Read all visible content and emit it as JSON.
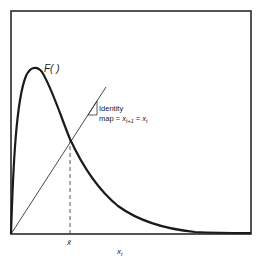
{
  "diagram": {
    "curve_label": "F( )",
    "identity_label_line1": "Identity",
    "identity_label_line2_prefix": "map = ",
    "identity_x": "x",
    "identity_sub_next": "t+1",
    "identity_eq": " = ",
    "identity_sub_cur": "t",
    "fixed_point_label": "x̄",
    "x_axis_label": "x",
    "x_axis_sub": "t",
    "colors": {
      "frame": "#2a2a2a",
      "curve": "#1a1a1a",
      "identity_line": "#333333",
      "dashed": "#444444",
      "background": "#ffffff"
    }
  }
}
